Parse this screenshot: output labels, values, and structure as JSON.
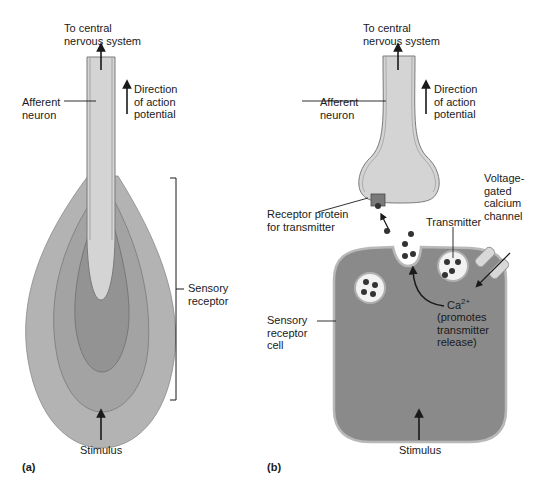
{
  "panel_a": {
    "label": "(a)",
    "to_cns": "To central\nnervous system",
    "direction": "Direction\nof action\npotential",
    "afferent": "Afferent\nneuron",
    "sensory_receptor": "Sensory\nreceptor",
    "stimulus": "Stimulus"
  },
  "panel_b": {
    "label": "(b)",
    "to_cns": "To central\nnervous system",
    "direction": "Direction\nof action\npotential",
    "afferent": "Afferent\nneuron",
    "voltage_channel": "Voltage-\ngated\ncalcium\nchannel",
    "receptor_protein": "Receptor protein\nfor transmitter",
    "transmitter": "Transmitter",
    "ca_ion": "Ca",
    "ca_charge": "2+",
    "ca_note": "(promotes\ntransmitter\nrelease)",
    "sensory_cell": "Sensory\nreceptor\ncell",
    "stimulus": "Stimulus"
  },
  "colors": {
    "axon_fill": "#d4d4d4",
    "outer_layer": "#b3b3b3",
    "middle_layer": "#a3a3a3",
    "inner_layer": "#939393",
    "cell_fill": "#8a8a8a",
    "vesicle_fill": "#f2f2f2",
    "dot": "#333333"
  }
}
